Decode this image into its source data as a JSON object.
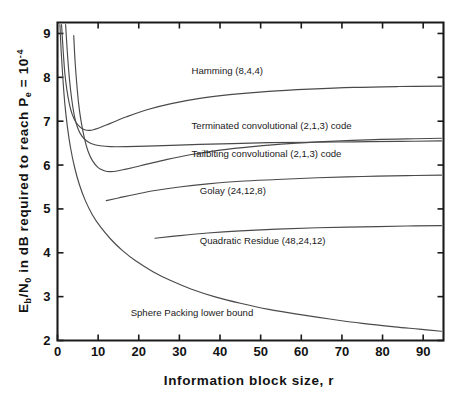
{
  "chart_data": {
    "type": "line",
    "title": "",
    "xlabel": "Information  block  size,  r",
    "ylabel_parts": {
      "eb": "E",
      "eb_sub": "b",
      "slash_n": "/N",
      "n_sub": "0",
      "mid": " in  dB  required  to  reach  P",
      "pe_sub": "e",
      "eq": " = ",
      "ten": "10",
      "exp": "-4"
    },
    "ylabel": "Eb/N0 in dB required to reach Pe = 10^-4",
    "xlim": [
      0,
      95
    ],
    "ylim": [
      2,
      9.25
    ],
    "xticks": [
      0,
      10,
      20,
      30,
      40,
      50,
      60,
      70,
      80,
      90
    ],
    "yticks": [
      2,
      3,
      4,
      5,
      6,
      7,
      8,
      9
    ],
    "grid": false,
    "legend": "inline-labels",
    "series": [
      {
        "name": "Hamming (8,4,4)",
        "label": "Hamming (8,4,4)",
        "label_x": 33,
        "label_y": 8.08,
        "points": [
          [
            1.0,
            9.2
          ],
          [
            1.4,
            8.6
          ],
          [
            1.8,
            8.1
          ],
          [
            2.3,
            7.72
          ],
          [
            2.9,
            7.4
          ],
          [
            3.6,
            7.16
          ],
          [
            4.5,
            6.98
          ],
          [
            5.5,
            6.87
          ],
          [
            6.5,
            6.81
          ],
          [
            8.0,
            6.79
          ],
          [
            10.0,
            6.84
          ],
          [
            13.0,
            6.95
          ],
          [
            17.0,
            7.1
          ],
          [
            22.0,
            7.26
          ],
          [
            28.0,
            7.4
          ],
          [
            35.0,
            7.52
          ],
          [
            43.0,
            7.61
          ],
          [
            52.0,
            7.68
          ],
          [
            62.0,
            7.73
          ],
          [
            73.0,
            7.77
          ],
          [
            84.0,
            7.79
          ],
          [
            94.5,
            7.8
          ]
        ]
      },
      {
        "name": "Terminated convolutional (2,1,3) code",
        "label": "Terminated convolutional (2,1,3) code",
        "label_x": 33,
        "label_y": 6.82,
        "points": [
          [
            2.0,
            9.2
          ],
          [
            2.4,
            8.6
          ],
          [
            2.9,
            8.0
          ],
          [
            3.5,
            7.5
          ],
          [
            4.2,
            7.1
          ],
          [
            5.0,
            6.84
          ],
          [
            6.0,
            6.66
          ],
          [
            7.2,
            6.55
          ],
          [
            8.6,
            6.48
          ],
          [
            10.5,
            6.44
          ],
          [
            13.0,
            6.42
          ],
          [
            17.0,
            6.42
          ],
          [
            22.0,
            6.43
          ],
          [
            28.0,
            6.45
          ],
          [
            35.0,
            6.47
          ],
          [
            43.0,
            6.49
          ],
          [
            52.0,
            6.51
          ],
          [
            62.0,
            6.52
          ],
          [
            73.0,
            6.53
          ],
          [
            84.0,
            6.54
          ],
          [
            94.5,
            6.55
          ]
        ]
      },
      {
        "name": "Tailbiting convolutional (2,1,3) code",
        "label": "Tailbiting convolutional (2,1,3) code",
        "label_x": 33,
        "label_y": 6.18,
        "points": [
          [
            4.0,
            8.95
          ],
          [
            4.3,
            8.4
          ],
          [
            4.7,
            7.9
          ],
          [
            5.2,
            7.4
          ],
          [
            5.8,
            7.0
          ],
          [
            6.6,
            6.62
          ],
          [
            7.5,
            6.32
          ],
          [
            8.6,
            6.1
          ],
          [
            10.0,
            5.94
          ],
          [
            11.5,
            5.87
          ],
          [
            13.0,
            5.85
          ],
          [
            15.0,
            5.87
          ],
          [
            18.0,
            5.93
          ],
          [
            22.0,
            6.02
          ],
          [
            27.0,
            6.13
          ],
          [
            33.0,
            6.24
          ],
          [
            40.0,
            6.34
          ],
          [
            48.0,
            6.42
          ],
          [
            57.0,
            6.49
          ],
          [
            67.0,
            6.54
          ],
          [
            78.0,
            6.58
          ],
          [
            88.0,
            6.6
          ],
          [
            94.5,
            6.61
          ]
        ]
      },
      {
        "name": "Golay (24,12,8)",
        "label": "Golay (24,12,8)",
        "label_x": 35,
        "label_y": 5.33,
        "points": [
          [
            12.0,
            5.19
          ],
          [
            15.0,
            5.25
          ],
          [
            19.0,
            5.33
          ],
          [
            24.0,
            5.42
          ],
          [
            30.0,
            5.5
          ],
          [
            37.0,
            5.57
          ],
          [
            45.0,
            5.63
          ],
          [
            54.0,
            5.67
          ],
          [
            64.0,
            5.71
          ],
          [
            75.0,
            5.74
          ],
          [
            86.0,
            5.76
          ],
          [
            94.5,
            5.77
          ]
        ]
      },
      {
        "name": "Quadratic Residue (48,24,12)",
        "label": "Quadratic Residue (48,24,12)",
        "label_x": 35,
        "label_y": 4.2,
        "points": [
          [
            24.0,
            4.33
          ],
          [
            30.0,
            4.39
          ],
          [
            37.0,
            4.45
          ],
          [
            45.0,
            4.5
          ],
          [
            54.0,
            4.54
          ],
          [
            64.0,
            4.57
          ],
          [
            75.0,
            4.59
          ],
          [
            86.0,
            4.61
          ],
          [
            94.5,
            4.62
          ]
        ]
      },
      {
        "name": "Sphere Packing lower bound",
        "label": "Sphere Packing lower bound",
        "label_x": 18,
        "label_y": 2.55,
        "points": [
          [
            0.6,
            9.2
          ],
          [
            0.9,
            8.6
          ],
          [
            1.3,
            8.0
          ],
          [
            1.8,
            7.4
          ],
          [
            2.4,
            6.9
          ],
          [
            3.2,
            6.4
          ],
          [
            4.2,
            5.95
          ],
          [
            5.4,
            5.55
          ],
          [
            6.8,
            5.2
          ],
          [
            8.5,
            4.88
          ],
          [
            10.5,
            4.6
          ],
          [
            13.0,
            4.32
          ],
          [
            16.0,
            4.05
          ],
          [
            19.5,
            3.8
          ],
          [
            23.5,
            3.57
          ],
          [
            28.0,
            3.36
          ],
          [
            33.0,
            3.17
          ],
          [
            39.0,
            2.99
          ],
          [
            45.0,
            2.85
          ],
          [
            52.0,
            2.71
          ],
          [
            59.0,
            2.6
          ],
          [
            67.0,
            2.49
          ],
          [
            75.0,
            2.39
          ],
          [
            83.0,
            2.31
          ],
          [
            89.0,
            2.26
          ],
          [
            94.5,
            2.21
          ]
        ]
      }
    ],
    "colors": {
      "axis": "#1a1a1a",
      "curve": "#4a4a4a",
      "background": "#ffffff",
      "text": "#121212"
    }
  }
}
